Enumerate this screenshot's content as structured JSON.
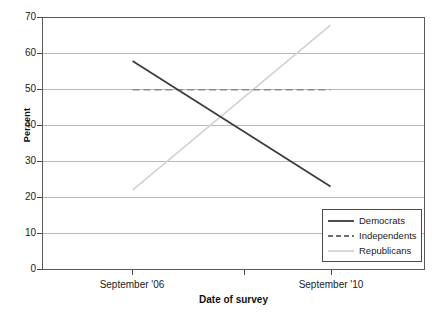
{
  "chart_data": {
    "type": "line",
    "title": "",
    "xlabel": "Date of survey",
    "ylabel": "Percent",
    "ylim": [
      0,
      70
    ],
    "yticks": [
      0,
      10,
      20,
      30,
      40,
      50,
      60,
      70
    ],
    "ytick_labels": [
      "0",
      "10",
      "20",
      "30",
      "40",
      "50",
      "60",
      "70"
    ],
    "x": [
      "September '06",
      "September '10"
    ],
    "xtick_labels": [
      "September '06",
      "September '10"
    ],
    "grid": "horizontal",
    "legend_position": "lower-right",
    "series": [
      {
        "name": "Democrats",
        "values": [
          58,
          23
        ],
        "style": "solid",
        "color": "#3b3b3b"
      },
      {
        "name": "Independents",
        "values": [
          50,
          50
        ],
        "style": "dashed",
        "color": "#8c8c8c"
      },
      {
        "name": "Republicans",
        "values": [
          22,
          68
        ],
        "style": "solid",
        "color": "#d2d2d2"
      }
    ]
  },
  "legend": {
    "entries": [
      {
        "label": "Democrats"
      },
      {
        "label": "Independents"
      },
      {
        "label": "Republicans"
      }
    ]
  },
  "axes": {
    "y_title": "Percent",
    "x_title": "Date of survey",
    "y_tick_0": "0",
    "y_tick_1": "10",
    "y_tick_2": "20",
    "y_tick_3": "30",
    "y_tick_4": "40",
    "y_tick_5": "50",
    "y_tick_6": "60",
    "y_tick_7": "70",
    "x_tick_0": "September '06",
    "x_tick_1": "September '10"
  },
  "colors": {
    "democrats": "#3b3b3b",
    "independents": "#8c8c8c",
    "republicans": "#d2d2d2",
    "gridline": "#b9b9b9",
    "frame": "#5a5a5a"
  }
}
